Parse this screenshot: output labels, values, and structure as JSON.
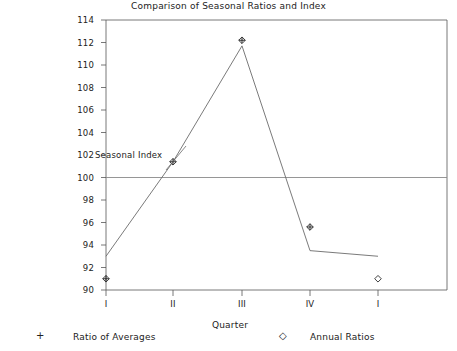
{
  "chart_data": {
    "type": "line",
    "title": "Comparison of Seasonal Ratios and Index",
    "xlabel": "Quarter",
    "ylabel": "",
    "categories": [
      "I",
      "II",
      "III",
      "IV",
      "I"
    ],
    "ylim": [
      90,
      114
    ],
    "yticks": [
      90,
      92,
      94,
      96,
      98,
      100,
      102,
      104,
      106,
      108,
      110,
      112,
      114
    ],
    "grid": false,
    "reference_line": {
      "value": 100,
      "label": ""
    },
    "legend_position": "below",
    "annotations": [
      {
        "text": "Seasonal Index",
        "x": "II",
        "y": 102.6
      }
    ],
    "series": [
      {
        "name": "Ratio of Averages",
        "marker": "plus",
        "values": [
          91.0,
          101.4,
          112.2,
          95.6,
          null
        ],
        "line": false
      },
      {
        "name": "Annual Ratios",
        "marker": "diamond",
        "values": [
          91.0,
          101.4,
          112.2,
          95.6,
          91.0
        ],
        "line": false
      },
      {
        "name": "Seasonal Index",
        "marker": "none",
        "values": [
          93.0,
          101.4,
          111.7,
          93.5,
          93.0
        ],
        "line": true
      }
    ]
  },
  "legend": {
    "entries": [
      {
        "glyph": "+",
        "glyph_name": "plus-marker-icon",
        "label": "Ratio of Averages"
      },
      {
        "glyph": "◇",
        "glyph_name": "diamond-marker-icon",
        "label": "Annual Ratios"
      }
    ]
  },
  "axis": {
    "y_labels": [
      "114",
      "112",
      "110",
      "108",
      "106",
      "104",
      "102",
      "100",
      "98",
      "96",
      "94",
      "92",
      "90"
    ],
    "x_labels": [
      "I",
      "II",
      "III",
      "IV",
      "I"
    ]
  },
  "colors": {
    "axis": "#555555",
    "line": "#6b6b6b",
    "reference_line": "#8a8a8a",
    "marker": "#2b2b2b",
    "text": "#222222",
    "background": "#ffffff"
  }
}
